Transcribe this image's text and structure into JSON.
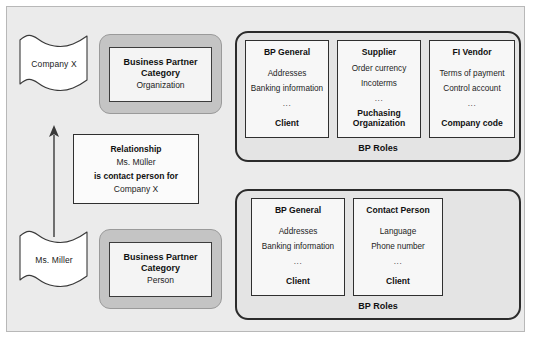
{
  "diagram": {
    "colors": {
      "canvas_background": "#ebebeb",
      "canvas_border": "#b8b8b8",
      "category_wrapper_fill": "#c4c4c4",
      "category_wrapper_border": "#9a9a9a",
      "category_inner_fill": "#f4f4f4",
      "roles_group_fill": "#e4e4e4",
      "roles_group_border": "#2b2b2b",
      "role_card_fill": "#f7f7f7",
      "role_card_border": "#2f2f2f",
      "banner_fill": "#ffffff",
      "banner_border": "#3a3a3a",
      "arrow_color": "#3a3a3a",
      "text_color": "#111111"
    }
  },
  "organization_branch": {
    "banner": {
      "label": "Company X",
      "icon": "banner-flag-icon"
    },
    "category": {
      "title_line1": "Business Partner",
      "title_line2": "Category",
      "value": "Organization"
    },
    "roles_group": {
      "caption": "BP Roles",
      "cards": [
        {
          "title": "BP General",
          "attributes": [
            "Addresses",
            "Banking information"
          ],
          "ellipsis": "...",
          "footer": "Client"
        },
        {
          "title": "Supplier",
          "attributes": [
            "Order currency",
            "Incoterms"
          ],
          "ellipsis": "...",
          "footer": "Puchasing Organization"
        },
        {
          "title": "FI Vendor",
          "attributes": [
            "Terms of payment",
            "Control account"
          ],
          "ellipsis": "...",
          "footer": "Company code"
        }
      ]
    }
  },
  "person_branch": {
    "banner": {
      "label": "Ms. Miller",
      "icon": "banner-flag-icon"
    },
    "category": {
      "title_line1": "Business Partner",
      "title_line2": "Category",
      "value": "Person"
    },
    "roles_group": {
      "caption": "BP Roles",
      "cards": [
        {
          "title": "BP General",
          "attributes": [
            "Addresses",
            "Banking information"
          ],
          "ellipsis": "...",
          "footer": "Client"
        },
        {
          "title": "Contact Person",
          "attributes": [
            "Language",
            "Phone number"
          ],
          "ellipsis": "...",
          "footer": "Client"
        }
      ]
    }
  },
  "relationship": {
    "heading": "Relationship",
    "subject": "Ms. Müller",
    "predicate": "is contact person for",
    "object": "Company X",
    "arrow": {
      "icon": "arrow-up-icon",
      "direction": "up"
    }
  }
}
